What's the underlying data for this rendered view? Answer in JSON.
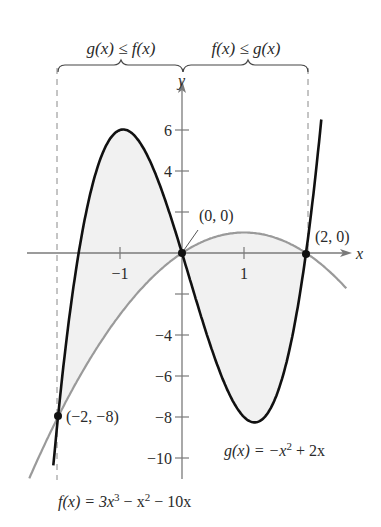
{
  "chart_data": {
    "type": "line",
    "title": "",
    "xlabel": "x",
    "ylabel": "y",
    "xlim": [
      -2.5,
      2.7
    ],
    "ylim": [
      -11,
      7.5
    ],
    "x_ticks": [
      {
        "value": -1,
        "label": "−1"
      },
      {
        "value": 1,
        "label": "1"
      }
    ],
    "y_ticks": [
      {
        "value": 6,
        "label": "6"
      },
      {
        "value": 4,
        "label": "4"
      },
      {
        "value": 2,
        "label": ""
      },
      {
        "value": -2,
        "label": ""
      },
      {
        "value": -4,
        "label": "−4"
      },
      {
        "value": -6,
        "label": "−6"
      },
      {
        "value": -8,
        "label": "−8"
      },
      {
        "value": -10,
        "label": "−10"
      }
    ],
    "grid": false,
    "series": [
      {
        "name": "f(x) = 3x³ − x² − 10x",
        "coefficients": [
          3,
          -1,
          -10,
          0
        ],
        "domain": [
          -2.075,
          2.265
        ],
        "color": "#111111",
        "width": 2.6
      },
      {
        "name": "g(x) = −x² + 2x",
        "coefficients": [
          0,
          -1,
          2,
          0
        ],
        "domain": [
          -2.5,
          2.7
        ],
        "color": "#9a9a9a",
        "width": 2.2
      }
    ],
    "shaded_region": {
      "between": [
        "f",
        "g"
      ],
      "x_from": -2,
      "x_to": 2,
      "color": "#f1f1f1"
    },
    "intersection_points": [
      {
        "x": -2,
        "y": -8,
        "label": "(−2, −8)"
      },
      {
        "x": 0,
        "y": 0,
        "label": "(0, 0)"
      },
      {
        "x": 2,
        "y": 0,
        "label": "(2, 0)"
      }
    ],
    "annotations": [
      {
        "text": "g(x) ≤ f(x)",
        "interval": [
          -2,
          0
        ]
      },
      {
        "text": "f(x) ≤ g(x)",
        "interval": [
          0,
          2
        ]
      }
    ]
  },
  "labels": {
    "left_brace": "g(x) ≤ f(x)",
    "right_brace": "f(x) ≤ g(x)",
    "x_axis": "x",
    "y_axis": "y",
    "f_equation_prefix": "f(x) = 3x",
    "f_equation_sup1": "3",
    "f_equation_mid": " − x",
    "f_equation_sup2": "2",
    "f_equation_tail": " − 10x",
    "g_equation_prefix": "g(x) = −x",
    "g_equation_sup": "2",
    "g_equation_tail": " + 2x",
    "point_neg2": "(−2, −8)",
    "point_origin": "(0, 0)",
    "point_2": "(2, 0)"
  }
}
